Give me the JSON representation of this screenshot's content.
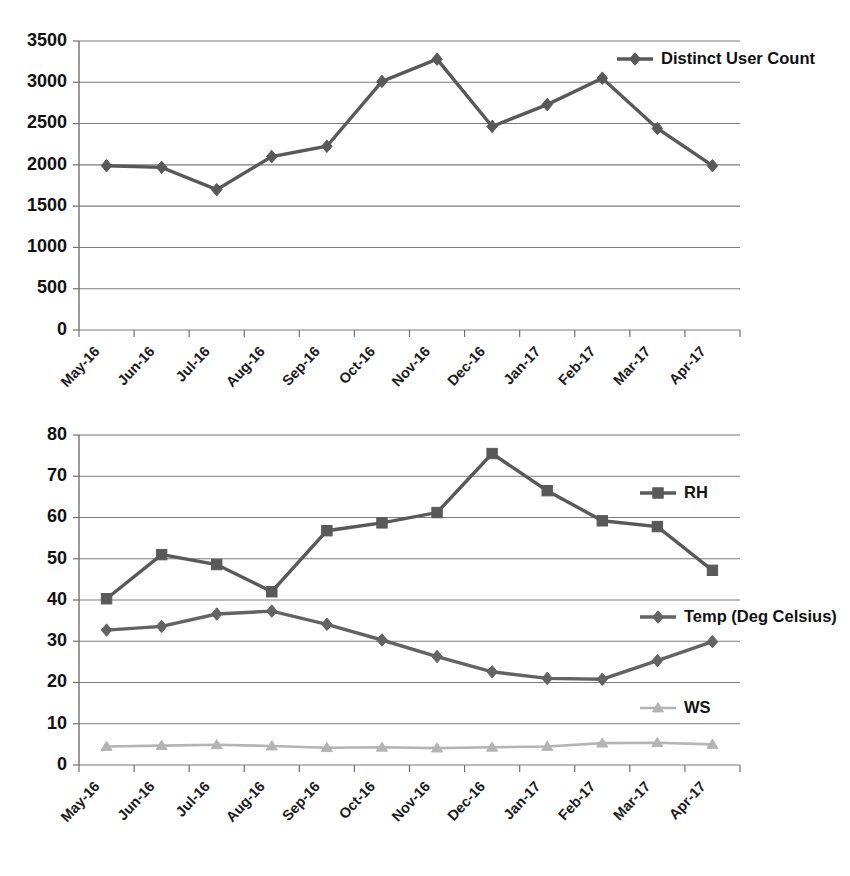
{
  "chart_data": [
    {
      "id": "distinct-user-count",
      "type": "line",
      "title": "",
      "xlabel": "",
      "ylabel": "",
      "ylim": [
        0,
        3500
      ],
      "ytick_step": 500,
      "yticks": [
        "0",
        "500",
        "1000",
        "1500",
        "2000",
        "2500",
        "3000",
        "3500"
      ],
      "grid": true,
      "legend_position": "top-right",
      "categories": [
        "May-16",
        "Jun-16",
        "Jul-16",
        "Aug-16",
        "Sep-16",
        "Oct-16",
        "Nov-16",
        "Dec-16",
        "Jan-17",
        "Feb-17",
        "Mar-17",
        "Apr-17"
      ],
      "series": [
        {
          "name": "Distinct User Count",
          "marker": "diamond",
          "color": "#595959",
          "values": [
            1990,
            1970,
            1700,
            2100,
            2225,
            3010,
            3280,
            2465,
            2730,
            3050,
            2440,
            1990
          ]
        }
      ]
    },
    {
      "id": "weather-parameters",
      "type": "line",
      "title": "",
      "xlabel": "",
      "ylabel": "",
      "ylim": [
        0,
        80
      ],
      "ytick_step": 10,
      "yticks": [
        "0",
        "10",
        "20",
        "30",
        "40",
        "50",
        "60",
        "70",
        "80"
      ],
      "grid": true,
      "legend_position": "right",
      "categories": [
        "May-16",
        "Jun-16",
        "Jul-16",
        "Aug-16",
        "Sep-16",
        "Oct-16",
        "Nov-16",
        "Dec-16",
        "Jan-17",
        "Feb-17",
        "Mar-17",
        "Apr-17"
      ],
      "series": [
        {
          "name": "RH",
          "marker": "square",
          "color": "#595959",
          "values": [
            40.3,
            51.0,
            48.6,
            42.0,
            56.8,
            58.7,
            61.2,
            75.5,
            66.5,
            59.2,
            57.8,
            47.2
          ]
        },
        {
          "name": "Temp (Deg Celsius)",
          "marker": "diamond",
          "color": "#636363",
          "values": [
            32.7,
            33.6,
            36.6,
            37.3,
            34.1,
            30.3,
            26.3,
            22.6,
            21.0,
            20.8,
            25.3,
            29.9
          ]
        },
        {
          "name": "WS",
          "marker": "triangle",
          "color": "#b4b4b4",
          "values": [
            4.5,
            4.7,
            4.9,
            4.6,
            4.2,
            4.3,
            4.1,
            4.3,
            4.5,
            5.3,
            5.4,
            5.0
          ]
        }
      ]
    }
  ],
  "legends": {
    "top": [
      {
        "label": "Distinct User Count",
        "marker": "diamond",
        "color": "#595959"
      }
    ],
    "bottom": [
      {
        "label": "RH",
        "marker": "square",
        "color": "#595959"
      },
      {
        "label": "Temp (Deg Celsius)",
        "marker": "diamond",
        "color": "#636363"
      },
      {
        "label": "WS",
        "marker": "triangle",
        "color": "#b4b4b4"
      }
    ]
  }
}
